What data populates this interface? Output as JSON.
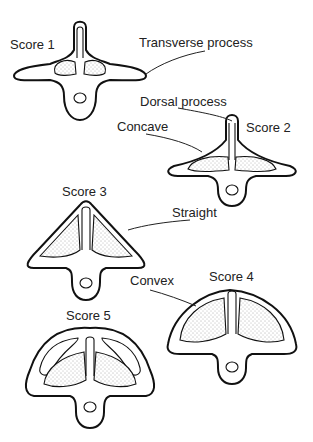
{
  "diagram": {
    "scores": [
      {
        "label": "Score 1"
      },
      {
        "label": "Score 2"
      },
      {
        "label": "Score 3"
      },
      {
        "label": "Score 4"
      },
      {
        "label": "Score 5"
      }
    ],
    "annotations": {
      "transverse_process": "Transverse process",
      "dorsal_process": "Dorsal process",
      "concave": "Concave",
      "straight": "Straight",
      "convex": "Convex"
    }
  }
}
